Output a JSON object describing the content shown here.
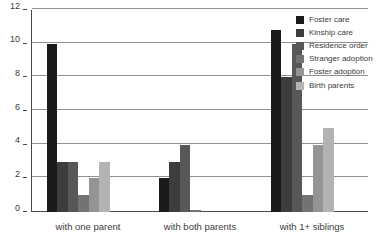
{
  "chart_data": {
    "type": "bar",
    "title": "",
    "xlabel": "",
    "ylabel": "",
    "ylim": [
      0,
      12
    ],
    "yticks": [
      0,
      2,
      4,
      6,
      8,
      10,
      12
    ],
    "grid": true,
    "legend_position": "top-right",
    "categories": [
      "with one parent",
      "with both parents",
      "with 1+ siblings"
    ],
    "series": [
      {
        "name": "Foster care",
        "color": "#1a1a1a",
        "values": [
          10,
          2,
          10.8
        ]
      },
      {
        "name": "Kinship care",
        "color": "#3d3d3d",
        "values": [
          3,
          3,
          8
        ]
      },
      {
        "name": "Residence order",
        "color": "#575757",
        "values": [
          3,
          4,
          10
        ]
      },
      {
        "name": "Stranger adoption",
        "color": "#737373",
        "values": [
          1,
          0.1,
          1
        ]
      },
      {
        "name": "Foster adoption",
        "color": "#949494",
        "values": [
          2,
          0,
          4
        ]
      },
      {
        "name": "Birth parents",
        "color": "#b3b3b3",
        "values": [
          3,
          0,
          5
        ]
      }
    ]
  },
  "axis": {
    "y_tick_labels": [
      "0",
      "2",
      "4",
      "6",
      "8",
      "10",
      "12"
    ]
  },
  "colors": {
    "axis_line": "#4a4a4a",
    "gridline": "#8f8f8f",
    "background": "#ffffff",
    "text": "#3b3b3b"
  }
}
